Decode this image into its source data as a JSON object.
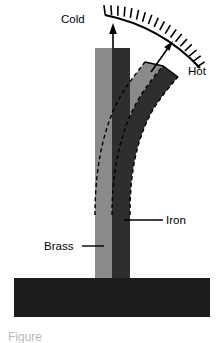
{
  "figure": {
    "background_color": "#ffffff",
    "caption_partial": "Figure"
  },
  "labels": {
    "cold": "Cold",
    "hot": "Hot",
    "iron": "Iron",
    "brass": "Brass"
  },
  "colors": {
    "brass": "#8a8a8a",
    "iron": "#2e2e2e",
    "base": "#1c1c1c",
    "outline": "#000000",
    "background": "#ffffff"
  },
  "elements": {
    "arc_scale_ticks": 16,
    "cold_arrow": "vertical-up-arrow",
    "hot_arrow": "diagonal-up-right-arrow",
    "base_block": "mounting-block",
    "strip_cold": "straight-bimetallic-strip",
    "strip_hot": "curved-bimetallic-strip",
    "dashed_outline": "deflected-position-outline"
  }
}
